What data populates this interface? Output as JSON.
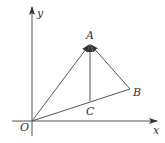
{
  "diagram": {
    "type": "vector-diagram",
    "axes": {
      "x_label": "x",
      "y_label": "y",
      "origin_label": "O"
    },
    "points": {
      "O": {
        "label": "O",
        "px": [
          32,
          121
        ]
      },
      "A": {
        "label": "A",
        "px": [
          90,
          44
        ]
      },
      "B": {
        "label": "B",
        "px": [
          130,
          89
        ]
      },
      "C": {
        "label": "C",
        "px": [
          90,
          101
        ]
      }
    },
    "segments": [
      {
        "from": "O",
        "to": "A",
        "arrow_at": "A"
      },
      {
        "from": "B",
        "to": "A",
        "arrow_at": "A"
      },
      {
        "from": "C",
        "to": "A",
        "arrow_at": "A"
      },
      {
        "from": "O",
        "to": "B",
        "arrow_at": null
      }
    ],
    "colors": {
      "line": "#555555",
      "text": "#333333",
      "background": "#ffffff"
    }
  }
}
